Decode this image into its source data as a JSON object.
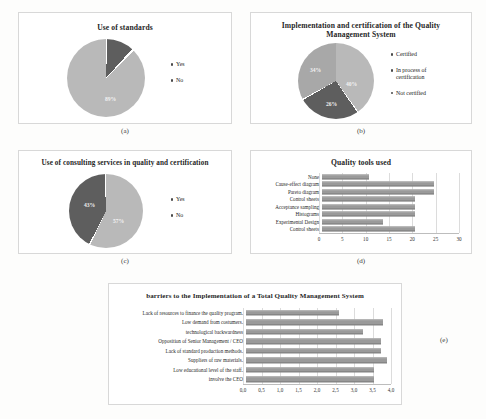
{
  "figure": {
    "background": "#fdfdfc",
    "panel_background": "#ffffff",
    "bar_color": "#9a9a9a",
    "pie_light": "#b9b9b9",
    "pie_mid": "#a8a8a8",
    "pie_dark": "#5e5e5e"
  },
  "panels": {
    "a": {
      "caption": "(a)",
      "title": "Use of standards",
      "legend": [
        "Yes",
        "No"
      ]
    },
    "b": {
      "caption": "(b)",
      "title": "Implementation  and certification of the Quality Management System",
      "title_line1": "Implementation  and certification of the Quality",
      "title_line2": "Management  System",
      "legend": [
        "Certified",
        "In process of certification",
        "Not certified"
      ],
      "legend_line_b1": "In process of",
      "legend_line_b2": "certification"
    },
    "c": {
      "caption": "(c)",
      "title": "Use of consulting  services in quality and certification",
      "legend": [
        "Yes",
        "No"
      ]
    },
    "d": {
      "caption": "(d)",
      "title": "Quality tools used"
    },
    "e": {
      "caption": "(e)",
      "title": "barriers to the Implementation  of a Total Quality Management  System"
    }
  },
  "chart_data": [
    {
      "id": "a",
      "type": "pie",
      "title": "Use of standards",
      "labels": [
        "Yes",
        "No"
      ],
      "values": [
        89,
        11
      ],
      "data_labels": [
        "89%",
        ""
      ],
      "colors": [
        "#b9b9b9",
        "#5e5e5e"
      ],
      "legend_position": "right"
    },
    {
      "id": "b",
      "type": "pie",
      "title": "Implementation  and certification of the Quality Management System",
      "labels": [
        "Certified",
        "In process of certification",
        "Not certified"
      ],
      "values": [
        40,
        26,
        34
      ],
      "data_labels": [
        "40%",
        "26%",
        "34%"
      ],
      "colors": [
        "#b9b9b9",
        "#5e5e5e",
        "#a8a8a8"
      ],
      "legend_position": "right"
    },
    {
      "id": "c",
      "type": "pie",
      "title": "Use of consulting  services in quality and certification",
      "labels": [
        "Yes",
        "No"
      ],
      "values": [
        57,
        43
      ],
      "data_labels": [
        "57%",
        "43%"
      ],
      "colors": [
        "#b9b9b9",
        "#5e5e5e"
      ],
      "legend_position": "right"
    },
    {
      "id": "d",
      "type": "bar",
      "orientation": "horizontal",
      "title": "Quality tools used",
      "categories": [
        "None",
        "Cause-effect diagram",
        "Pareto diagram",
        "Control sheets",
        "Acceptance sampling",
        "Histograms",
        "Experimental Design",
        "Control sheets"
      ],
      "values": [
        10,
        24,
        24,
        20,
        20,
        20,
        13,
        20
      ],
      "xlabel": "",
      "ylabel": "",
      "xlim": [
        0,
        30
      ],
      "ticks": [
        "0",
        "5",
        "10",
        "15",
        "20",
        "25",
        "30"
      ],
      "tick_values": [
        0,
        5,
        10,
        15,
        20,
        25,
        30
      ],
      "grid": true
    },
    {
      "id": "e",
      "type": "bar",
      "orientation": "horizontal",
      "title": "barriers to the Implementation  of a Total Quality Management  System",
      "categories": [
        "Lack of resources to finance the quality program.",
        "Low demand from costumers.",
        "technological backwardness",
        "Opposition of Senior Management / CEO",
        "Lack of standard production methods.",
        "Suppliers of raw materials.",
        "Low educational level of the staff.",
        "involve the CEO"
      ],
      "values": [
        2.5,
        3.7,
        3.15,
        3.65,
        3.65,
        3.8,
        3.45,
        3.45
      ],
      "xlabel": "",
      "ylabel": "",
      "xlim": [
        0,
        4.0
      ],
      "ticks": [
        "0,0",
        "0,5",
        "1,0",
        "1,5",
        "2,0",
        "2,5",
        "3,0",
        "3,5",
        "4,0"
      ],
      "tick_values": [
        0,
        0.5,
        1.0,
        1.5,
        2.0,
        2.5,
        3.0,
        3.5,
        4.0
      ],
      "grid": true
    }
  ]
}
